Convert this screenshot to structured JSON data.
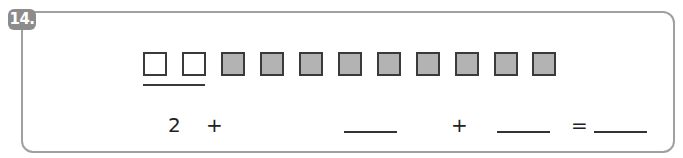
{
  "exercise": {
    "number": "14.",
    "badge_color": "#8c8c8c",
    "frame_color": "#a0a0a0"
  },
  "squares": {
    "white_count": 2,
    "gray_count": 9,
    "items": [
      {
        "type": "white"
      },
      {
        "type": "white"
      },
      {
        "type": "gray"
      },
      {
        "type": "gray"
      },
      {
        "type": "gray"
      },
      {
        "type": "gray"
      },
      {
        "type": "gray"
      },
      {
        "type": "gray"
      },
      {
        "type": "gray"
      },
      {
        "type": "gray"
      },
      {
        "type": "gray"
      }
    ],
    "gray_fill": "#b3b3b3"
  },
  "equation": {
    "first_term": "2",
    "plus1": "+",
    "plus2": "+",
    "equals": "=",
    "blank1": "",
    "blank2": "",
    "blank3": ""
  }
}
